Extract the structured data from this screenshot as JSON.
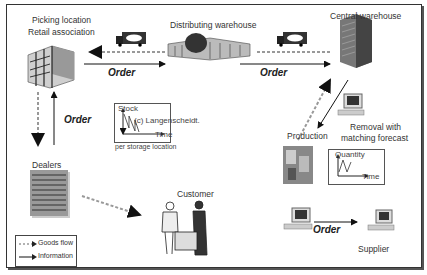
{
  "nodes": {
    "picking_location": {
      "line1": "Picking location",
      "line2": "Retail association"
    },
    "distributing_warehouse": {
      "label": "Distributing warehouse"
    },
    "central_warehouse": {
      "label": "Central warehouse"
    },
    "dealers": {
      "label": "Dealers"
    },
    "customer": {
      "label": "Customer"
    },
    "production": {
      "label": "Production"
    },
    "removal": {
      "line1": "Removal with",
      "line2": "matching forecast"
    },
    "supplier": {
      "label": "Supplier"
    }
  },
  "order_labels": {
    "picking_to_distributing": "Order",
    "distributing_to_central": "Order",
    "picking_to_dealers": "Order",
    "computer_to_supplier": "Order"
  },
  "stock_chart": {
    "ylabel": "Stock",
    "xlabel": "Time",
    "watermark": "(c) Langenscheidt.",
    "caption": "per storage location"
  },
  "quantity_chart": {
    "ylabel": "Quantity",
    "xlabel": "Time"
  },
  "legend": {
    "goods_flow": "Goods flow",
    "information": "Information"
  },
  "icons": [
    "truck-icon",
    "office-building-icon",
    "warehouse-icon",
    "skyscraper-icon",
    "computer-icon",
    "dealers-list-icon",
    "customer-icon",
    "production-icon"
  ]
}
